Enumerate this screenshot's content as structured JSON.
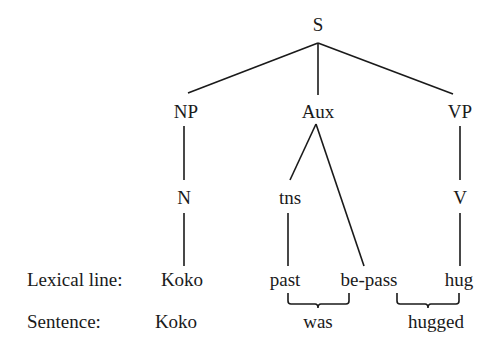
{
  "diagram": {
    "type": "syntax-tree",
    "line_color": "#1a1a1a",
    "nodes": {
      "S": "S",
      "NP": "NP",
      "Aux": "Aux",
      "VP": "VP",
      "N": "N",
      "tns": "tns",
      "V": "V"
    },
    "lexical_line": {
      "label": "Lexical line:",
      "items": [
        "Koko",
        "past",
        "be-pass",
        "hug"
      ]
    },
    "sentence_line": {
      "label": "Sentence:",
      "items": [
        "Koko",
        "was",
        "hugged"
      ]
    },
    "edges": [
      [
        "S",
        "NP"
      ],
      [
        "S",
        "Aux"
      ],
      [
        "S",
        "VP"
      ],
      [
        "NP",
        "N"
      ],
      [
        "N",
        "Koko"
      ],
      [
        "Aux",
        "tns"
      ],
      [
        "Aux",
        "be-pass"
      ],
      [
        "tns",
        "past"
      ],
      [
        "VP",
        "V"
      ],
      [
        "V",
        "hug"
      ]
    ],
    "brackets": [
      {
        "spans": [
          "past",
          "be-pass"
        ],
        "label": "was"
      },
      {
        "spans": [
          "be-pass",
          "hug"
        ],
        "label": "hugged"
      }
    ]
  }
}
